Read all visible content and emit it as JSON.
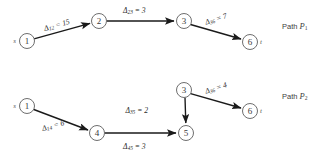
{
  "figure": {
    "background_color": "#ffffff",
    "node_stroke_color": "#6e6e6e",
    "edge_color": "#1a1a1a",
    "text_color": "#2a2a2a"
  },
  "diagrams": [
    {
      "id": "path-p1",
      "path_label_prefix": "Path ",
      "path_label_var": "P",
      "path_label_sub": "1",
      "source_marker": "s",
      "sink_marker": "t",
      "nodes": [
        {
          "id": "n1",
          "label": "1",
          "cx": 27,
          "cy": 41,
          "r": 7.5,
          "marker": "s",
          "marker_side": "left"
        },
        {
          "id": "n2",
          "label": "2",
          "cx": 99,
          "cy": 21,
          "r": 7.5,
          "marker": "",
          "marker_side": ""
        },
        {
          "id": "n3",
          "label": "3",
          "cx": 184,
          "cy": 21,
          "r": 7.5,
          "marker": "",
          "marker_side": ""
        },
        {
          "id": "n6",
          "label": "6",
          "cx": 250,
          "cy": 42,
          "r": 7.5,
          "marker": "t",
          "marker_side": "right"
        }
      ],
      "edges": [
        {
          "id": "e12",
          "from": "n1",
          "to": "n2",
          "label_sym": "Δ",
          "label_sub": "12",
          "label_eq": " = ",
          "label_val": "15",
          "label_x": 44,
          "label_y": 28,
          "label_rotate": -16
        },
        {
          "id": "e23",
          "from": "n2",
          "to": "n3",
          "label_sym": "Δ",
          "label_sub": "23",
          "label_eq": " = ",
          "label_val": "3",
          "label_x": 123,
          "label_y": 10,
          "label_rotate": 0
        },
        {
          "id": "e36",
          "from": "n3",
          "to": "n6",
          "label_sym": "Δ",
          "label_sub": "36",
          "label_eq": " = ",
          "label_val": "7",
          "label_x": 205,
          "label_y": 22,
          "label_rotate": -18
        }
      ],
      "path_label_x": 282,
      "path_label_y": 26
    },
    {
      "id": "path-p2",
      "path_label_prefix": "Path ",
      "path_label_var": "P",
      "path_label_sub": "2",
      "source_marker": "s",
      "sink_marker": "t",
      "nodes": [
        {
          "id": "m1",
          "label": "1",
          "cx": 27,
          "cy": 106,
          "r": 7.5,
          "marker": "s",
          "marker_side": "left"
        },
        {
          "id": "m4",
          "label": "4",
          "cx": 97,
          "cy": 133,
          "r": 7.5,
          "marker": "",
          "marker_side": ""
        },
        {
          "id": "m5",
          "label": "5",
          "cx": 186,
          "cy": 133,
          "r": 7.5,
          "marker": "",
          "marker_side": ""
        },
        {
          "id": "m3",
          "label": "3",
          "cx": 184,
          "cy": 90,
          "r": 7.5,
          "marker": "",
          "marker_side": ""
        },
        {
          "id": "m6",
          "label": "6",
          "cx": 250,
          "cy": 111,
          "r": 7.5,
          "marker": "t",
          "marker_side": "right"
        }
      ],
      "edges": [
        {
          "id": "f14",
          "from": "m1",
          "to": "m4",
          "label_sym": "Δ",
          "label_sub": "14",
          "label_eq": " = ",
          "label_val": "6",
          "label_x": 42,
          "label_y": 128,
          "label_rotate": -15
        },
        {
          "id": "f45",
          "from": "m4",
          "to": "m5",
          "label_sym": "Δ",
          "label_sub": "45",
          "label_eq": " = ",
          "label_val": "3",
          "label_x": 123,
          "label_y": 146,
          "label_rotate": 0
        },
        {
          "id": "f35",
          "from": "m3",
          "to": "m5",
          "label_sym": "Δ",
          "label_sub": "35",
          "label_eq": " = ",
          "label_val": "2",
          "label_x": 148,
          "label_y": 110,
          "label_rotate": 0
        },
        {
          "id": "f36",
          "from": "m3",
          "to": "m6",
          "label_sym": "Δ",
          "label_sub": "36",
          "label_eq": " = ",
          "label_val": "4",
          "label_x": 205,
          "label_y": 91,
          "label_rotate": -18
        }
      ],
      "path_label_x": 282,
      "path_label_y": 96
    }
  ]
}
